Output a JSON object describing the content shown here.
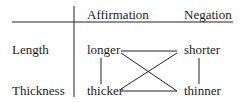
{
  "headers": {
    "affirmation": "Affirmation",
    "negation": "Negation"
  },
  "rows": [
    {
      "label": "Length",
      "affirmation": "longer",
      "negation": "shorter"
    },
    {
      "label": "Thickness",
      "affirmation": "thicker",
      "negation": "thinner"
    }
  ],
  "colors": {
    "ink": "#222222",
    "background": "#ffffff"
  }
}
